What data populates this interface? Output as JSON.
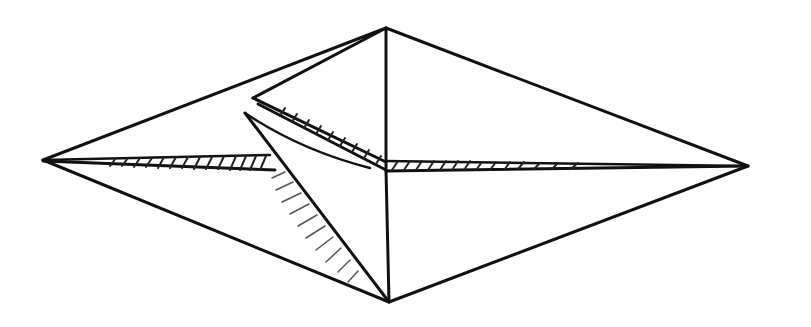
{
  "figure": {
    "colors": {
      "ink": "#111111",
      "background": "#ffffff"
    },
    "points": {
      "left_tip": [
        43,
        160
      ],
      "right_tip": [
        748,
        166
      ],
      "top_apex": [
        386,
        28
      ],
      "bottom_apex": [
        389,
        302
      ],
      "center": [
        386,
        168
      ],
      "flap_tip_upper": [
        253,
        98
      ],
      "flap_tip_lower": [
        245,
        113
      ],
      "horizontal_fold_left_end_of_hatch": [
        270,
        163
      ]
    }
  }
}
